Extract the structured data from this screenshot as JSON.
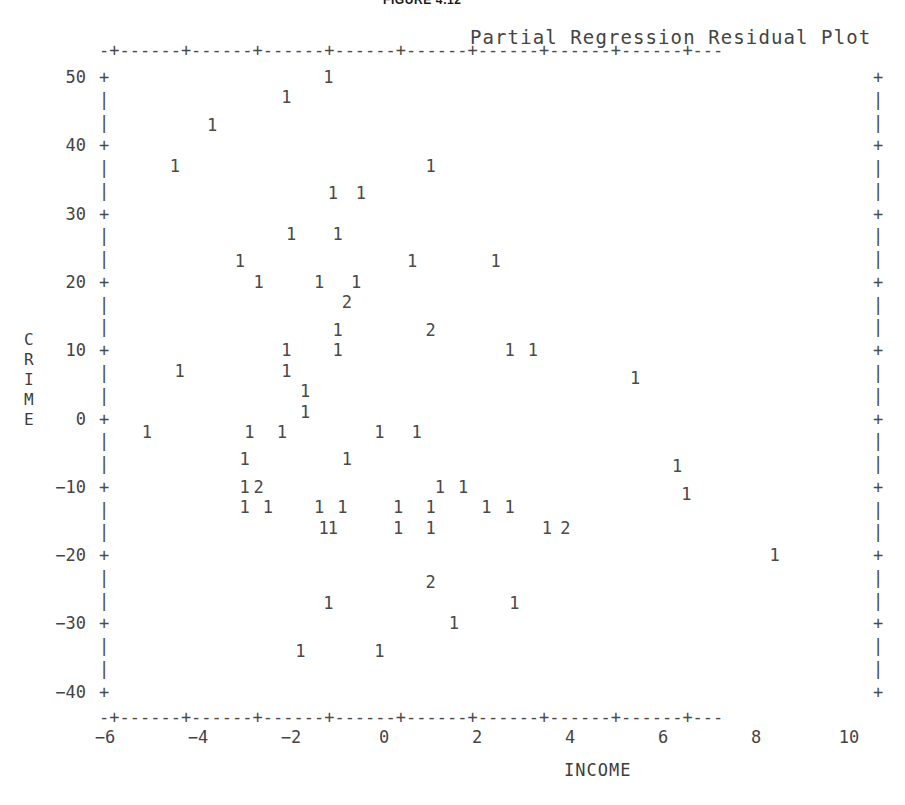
{
  "figure": {
    "caption": "FIGURE 4.12",
    "title": "Partial Regression Residual Plot"
  },
  "axes": {
    "x": {
      "label": "INCOME",
      "ticks": [
        -6,
        -4,
        -2,
        0,
        2,
        4,
        6,
        8,
        10
      ],
      "tick_labels": [
        "−6",
        "−4",
        "−2",
        "0",
        "2",
        "4",
        "6",
        "8",
        "10"
      ],
      "range": [
        -6.6,
        11.2
      ],
      "rule": "-+------+------+------+------+------+------+------+------+---"
    },
    "y": {
      "label": "CRIME",
      "label_chars": [
        "C",
        "R",
        "I",
        "M",
        "E"
      ],
      "ticks": [
        50,
        40,
        30,
        20,
        10,
        0,
        -10,
        -20,
        -30,
        -40
      ],
      "tick_labels": [
        "50",
        "40",
        "30",
        "20",
        "10",
        "0",
        "−10",
        "−20",
        "−30",
        "−40"
      ],
      "range": [
        -44,
        54
      ],
      "tick_mark": "+",
      "minor_mark": "|"
    }
  },
  "chart_data": {
    "type": "scatter",
    "title": "Partial Regression Residual Plot",
    "xlabel": "INCOME",
    "ylabel": "CRIME",
    "xlim": [
      -6.6,
      11.2
    ],
    "ylim": [
      -44,
      54
    ],
    "grid": false,
    "legend": false,
    "note": "Character plot: each glyph is the count of observations at that cell; '1' = one point, '2' = two coincident points.",
    "points": [
      {
        "x": -1.2,
        "y": 50,
        "n": "1"
      },
      {
        "x": -2.1,
        "y": 47,
        "n": "1"
      },
      {
        "x": -3.7,
        "y": 43,
        "n": "1"
      },
      {
        "x": -4.5,
        "y": 37,
        "n": "1"
      },
      {
        "x": 1.0,
        "y": 37,
        "n": "1"
      },
      {
        "x": -1.1,
        "y": 33,
        "n": "1"
      },
      {
        "x": -0.5,
        "y": 33,
        "n": "1"
      },
      {
        "x": -2.0,
        "y": 27,
        "n": "1"
      },
      {
        "x": -1.0,
        "y": 27,
        "n": "1"
      },
      {
        "x": -3.1,
        "y": 23,
        "n": "1"
      },
      {
        "x": 0.6,
        "y": 23,
        "n": "1"
      },
      {
        "x": 2.4,
        "y": 23,
        "n": "1"
      },
      {
        "x": -2.7,
        "y": 20,
        "n": "1"
      },
      {
        "x": -1.4,
        "y": 20,
        "n": "1"
      },
      {
        "x": -0.6,
        "y": 20,
        "n": "1"
      },
      {
        "x": -0.8,
        "y": 17,
        "n": "2"
      },
      {
        "x": -1.0,
        "y": 13,
        "n": "1"
      },
      {
        "x": 1.0,
        "y": 13,
        "n": "2"
      },
      {
        "x": -2.1,
        "y": 10,
        "n": "1"
      },
      {
        "x": -1.0,
        "y": 10,
        "n": "1"
      },
      {
        "x": 2.7,
        "y": 10,
        "n": "1"
      },
      {
        "x": 3.2,
        "y": 10,
        "n": "1"
      },
      {
        "x": -4.4,
        "y": 7,
        "n": "1"
      },
      {
        "x": -2.1,
        "y": 7,
        "n": "1"
      },
      {
        "x": 5.4,
        "y": 6,
        "n": "1"
      },
      {
        "x": -1.7,
        "y": 4,
        "n": "1"
      },
      {
        "x": -1.7,
        "y": 1,
        "n": "1"
      },
      {
        "x": -5.1,
        "y": -2,
        "n": "1"
      },
      {
        "x": -2.9,
        "y": -2,
        "n": "1"
      },
      {
        "x": -2.2,
        "y": -2,
        "n": "1"
      },
      {
        "x": -0.1,
        "y": -2,
        "n": "1"
      },
      {
        "x": 0.7,
        "y": -2,
        "n": "1"
      },
      {
        "x": -3.0,
        "y": -6,
        "n": "1"
      },
      {
        "x": -0.8,
        "y": -6,
        "n": "1"
      },
      {
        "x": 6.3,
        "y": -7,
        "n": "1"
      },
      {
        "x": -3.0,
        "y": -10,
        "n": "1"
      },
      {
        "x": -2.7,
        "y": -10,
        "n": "2"
      },
      {
        "x": 1.2,
        "y": -10,
        "n": "1"
      },
      {
        "x": 1.7,
        "y": -10,
        "n": "1"
      },
      {
        "x": 6.5,
        "y": -11,
        "n": "1"
      },
      {
        "x": -3.0,
        "y": -13,
        "n": "1"
      },
      {
        "x": -2.5,
        "y": -13,
        "n": "1"
      },
      {
        "x": -1.4,
        "y": -13,
        "n": "1"
      },
      {
        "x": -0.9,
        "y": -13,
        "n": "1"
      },
      {
        "x": 0.3,
        "y": -13,
        "n": "1"
      },
      {
        "x": 1.0,
        "y": -13,
        "n": "1"
      },
      {
        "x": 2.2,
        "y": -13,
        "n": "1"
      },
      {
        "x": 2.7,
        "y": -13,
        "n": "1"
      },
      {
        "x": -1.3,
        "y": -16,
        "n": "1"
      },
      {
        "x": -1.1,
        "y": -16,
        "n": "1"
      },
      {
        "x": 0.3,
        "y": -16,
        "n": "1"
      },
      {
        "x": 1.0,
        "y": -16,
        "n": "1"
      },
      {
        "x": 3.5,
        "y": -16,
        "n": "1"
      },
      {
        "x": 3.9,
        "y": -16,
        "n": "2"
      },
      {
        "x": 8.4,
        "y": -20,
        "n": "1"
      },
      {
        "x": 1.0,
        "y": -24,
        "n": "2"
      },
      {
        "x": -1.2,
        "y": -27,
        "n": "1"
      },
      {
        "x": 2.8,
        "y": -27,
        "n": "1"
      },
      {
        "x": 1.5,
        "y": -30,
        "n": "1"
      },
      {
        "x": -1.8,
        "y": -34,
        "n": "1"
      },
      {
        "x": -0.1,
        "y": -34,
        "n": "1"
      }
    ]
  }
}
